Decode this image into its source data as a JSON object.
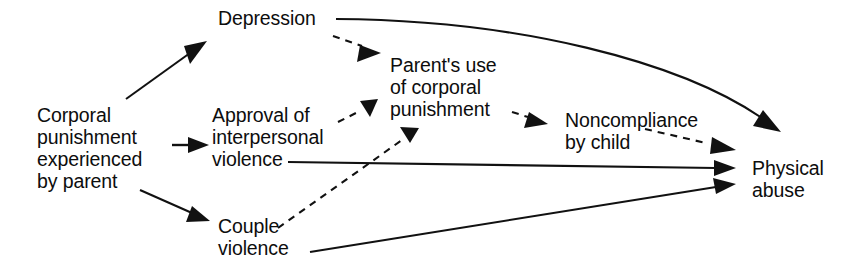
{
  "diagram": {
    "type": "path-diagram",
    "background_color": "#ffffff",
    "line_color": "#111111",
    "text_color": "#0d0d0d",
    "nodes": [
      {
        "id": "corporal-punishment-experienced",
        "label": "Corporal\npunishment\nexperienced\nby parent",
        "x": 37,
        "y": 104
      },
      {
        "id": "depression",
        "label": "Depression",
        "x": 218,
        "y": 7
      },
      {
        "id": "approval-interpersonal-violence",
        "label": "Approval of\ninterpersonal\nviolence",
        "x": 212,
        "y": 104
      },
      {
        "id": "couple-violence",
        "label": "Couple\nviolence",
        "x": 218,
        "y": 215
      },
      {
        "id": "parents-use-corporal-punishment",
        "label": "Parent's use\nof corporal\npunishment",
        "x": 390,
        "y": 54
      },
      {
        "id": "noncompliance-by-child",
        "label": "Noncompliance\nby child",
        "x": 565,
        "y": 109
      },
      {
        "id": "physical-abuse",
        "label": "Physical\nabuse",
        "x": 752,
        "y": 157
      }
    ],
    "edges": [
      {
        "id": "corporal-to-depression",
        "from": "corporal-punishment-experienced",
        "to": "depression",
        "style": "solid"
      },
      {
        "id": "corporal-to-approval",
        "from": "corporal-punishment-experienced",
        "to": "approval-interpersonal-violence",
        "style": "solid"
      },
      {
        "id": "corporal-to-couple-violence",
        "from": "corporal-punishment-experienced",
        "to": "couple-violence",
        "style": "solid"
      },
      {
        "id": "depression-to-parents-use",
        "from": "depression",
        "to": "parents-use-corporal-punishment",
        "style": "dashed"
      },
      {
        "id": "depression-to-physical-abuse",
        "from": "depression",
        "to": "physical-abuse",
        "style": "solid"
      },
      {
        "id": "approval-to-parents-use",
        "from": "approval-interpersonal-violence",
        "to": "parents-use-corporal-punishment",
        "style": "dashed"
      },
      {
        "id": "approval-to-physical-abuse",
        "from": "approval-interpersonal-violence",
        "to": "physical-abuse",
        "style": "solid"
      },
      {
        "id": "couple-violence-to-parents-use",
        "from": "couple-violence",
        "to": "parents-use-corporal-punishment",
        "style": "dashed"
      },
      {
        "id": "couple-violence-to-physical-abuse",
        "from": "couple-violence",
        "to": "physical-abuse",
        "style": "solid"
      },
      {
        "id": "parents-use-to-noncompliance",
        "from": "parents-use-corporal-punishment",
        "to": "noncompliance-by-child",
        "style": "dashed"
      },
      {
        "id": "noncompliance-to-physical-abuse",
        "from": "noncompliance-by-child",
        "to": "physical-abuse",
        "style": "dashed"
      }
    ]
  }
}
